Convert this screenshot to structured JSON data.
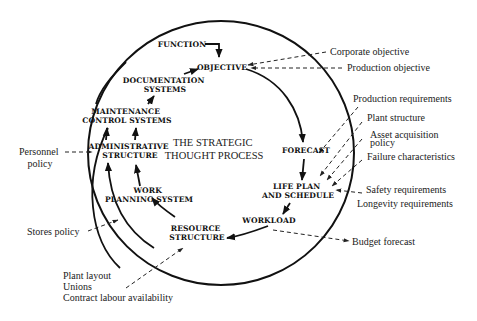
{
  "diagram": {
    "title_lines": [
      "THE STRATEGIC",
      "THOUGHT PROCESS"
    ],
    "nodes": {
      "function": [
        "FUNCTION"
      ],
      "objective": [
        "OBJECTIVE"
      ],
      "documentation_systems": [
        "DOCUMENTATION",
        "SYSTEMS"
      ],
      "maintenance_control_systems": [
        "MAINTENANCE",
        "CONTROL SYSTEMS"
      ],
      "administrative_structure": [
        "ADMINISTRATIVE",
        "STRUCTURE"
      ],
      "work_planning_system": [
        "WORK",
        "PLANNING SYSTEM"
      ],
      "resource_structure": [
        "RESOURCE",
        "STRUCTURE"
      ],
      "workload": [
        "WORKLOAD"
      ],
      "life_plan_and_schedule": [
        "LIFE PLAN",
        "AND SCHEDULE"
      ],
      "forecast": [
        "FORECAST"
      ]
    },
    "external_inputs": {
      "corporate_objective": [
        "Corporate objective"
      ],
      "production_objective": [
        "Production objective"
      ],
      "production_requirements": [
        "Production requirements"
      ],
      "plant_structure": [
        "Plant structure"
      ],
      "asset_acquisition_policy": [
        "Asset acquisition",
        "policy"
      ],
      "failure_characteristics": [
        "Failure characteristics"
      ],
      "safety_requirements": [
        "Safety requirements"
      ],
      "longevity_requirements": [
        "Longevity requirements"
      ],
      "personnel_policy": [
        "Personnel",
        "policy"
      ],
      "stores_policy": [
        "Stores policy"
      ],
      "resource_inputs": [
        "Plant layout",
        "Unions",
        "Contract labour availability"
      ]
    },
    "external_outputs": {
      "budget_forecast": [
        "Budget forecast"
      ]
    },
    "flow": [
      "FUNCTION -> OBJECTIVE",
      "OBJECTIVE -> FORECAST",
      "FORECAST -> LIFE PLAN AND SCHEDULE",
      "LIFE PLAN AND SCHEDULE -> WORKLOAD",
      "WORKLOAD -> RESOURCE STRUCTURE",
      "RESOURCE STRUCTURE -> WORK PLANNING SYSTEM",
      "RESOURCE STRUCTURE -> ADMINISTRATIVE STRUCTURE",
      "WORK PLANNING SYSTEM -> ADMINISTRATIVE STRUCTURE",
      "ADMINISTRATIVE STRUCTURE -> MAINTENANCE CONTROL SYSTEMS",
      "MAINTENANCE CONTROL SYSTEMS -> DOCUMENTATION SYSTEMS",
      "DOCUMENTATION SYSTEMS -> OBJECTIVE"
    ],
    "colors": {
      "ink": "#111111",
      "background": "#ffffff"
    }
  }
}
